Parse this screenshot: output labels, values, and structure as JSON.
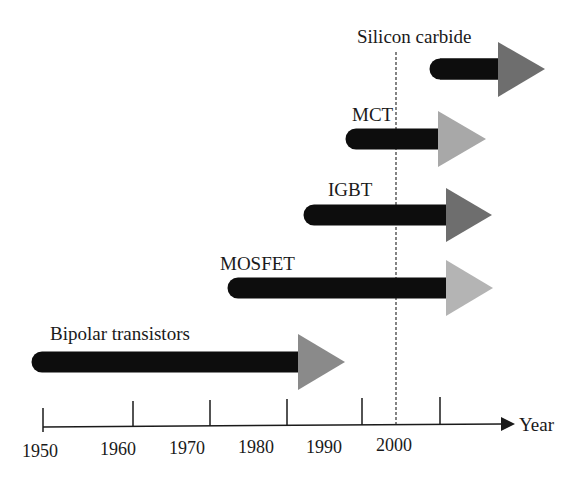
{
  "diagram": {
    "type": "timeline",
    "axis": {
      "label": "Year",
      "ticks": [
        {
          "label": "1950",
          "x": 43
        },
        {
          "label": "1960",
          "x": 133
        },
        {
          "label": "1970",
          "x": 210
        },
        {
          "label": "1980",
          "x": 287
        },
        {
          "label": "1990",
          "x": 362
        },
        {
          "label": "2000",
          "x": 440
        }
      ]
    },
    "marker_line": {
      "style": "dashed",
      "approx_year": 1995
    },
    "technologies": [
      {
        "name": "Silicon carbide",
        "start_year": 1999,
        "head_color": "#6e6e6e"
      },
      {
        "name": "MCT",
        "start_year": 1988,
        "head_color": "#a8a8a8"
      },
      {
        "name": "IGBT",
        "start_year": 1983,
        "head_color": "#6e6e6e"
      },
      {
        "name": "MOSFET",
        "start_year": 1973,
        "head_color": "#b4b4b4"
      },
      {
        "name": "Bipolar transistors",
        "start_year": 1950,
        "head_color": "#8a8a8a"
      }
    ],
    "colors": {
      "bar": "#0d0d0d",
      "axis": "#1a1a1a"
    }
  }
}
